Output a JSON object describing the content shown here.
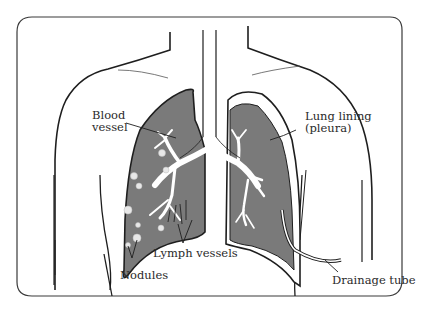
{
  "diagram": {
    "colors": {
      "lung_fill": "#7a7a7a",
      "outline": "#1e1e1e",
      "background": "#ffffff",
      "airway": "#ffffff"
    },
    "labels": {
      "blood_vessel_line1": "Blood",
      "blood_vessel_line2": "vessel",
      "lung_lining_line1": "Lung lining",
      "lung_lining_line2": "(pleura)",
      "lymph_vessels": "Lymph vessels",
      "nodules": "Nodules",
      "drainage_tube": "Drainage tube"
    }
  }
}
